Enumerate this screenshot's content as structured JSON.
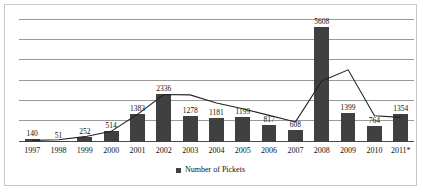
{
  "chart_data": {
    "type": "bar",
    "title": "",
    "xlabel": "",
    "ylabel": "",
    "ylim": [
      0,
      6000
    ],
    "grid": true,
    "gridline_count": 6,
    "legend_position": "bottom",
    "categories": [
      "1997",
      "1998",
      "1999",
      "2000",
      "2001",
      "2002",
      "2003",
      "2004",
      "2005",
      "2006",
      "2007",
      "2008",
      "2009",
      "2010",
      "2011*"
    ],
    "series": [
      {
        "name": "Number of Pickets",
        "type": "bar",
        "color": "#404040",
        "values": [
          140,
          51,
          252,
          514,
          1383,
          2336,
          1278,
          1181,
          1199,
          817,
          608,
          5608,
          1399,
          764,
          1354
        ],
        "data_labels": [
          "140",
          "51",
          "252",
          "514",
          "1383",
          "2336",
          "1278",
          "1181",
          "1199",
          "817",
          "608",
          "5608",
          "1399",
          "764",
          "1354"
        ]
      },
      {
        "name": "Trend",
        "type": "line",
        "color": "#222222",
        "values": [
          80,
          110,
          260,
          520,
          1350,
          2320,
          2300,
          1900,
          1620,
          1300,
          980,
          2980,
          3520,
          1280,
          1200
        ]
      }
    ]
  },
  "legend": {
    "marker": "square-marker",
    "label": "Number of Pickets"
  }
}
